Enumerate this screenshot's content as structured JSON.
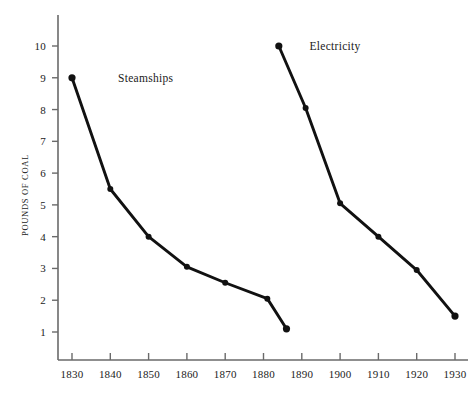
{
  "chart_data": {
    "type": "line",
    "title": "",
    "subtitle": "",
    "xlabel": "",
    "ylabel": "POUNDS OF COAL",
    "xlim": [
      1825,
      1935
    ],
    "ylim": [
      0,
      10.6
    ],
    "grid": false,
    "legend_position": "inline-annotation",
    "x_ticks": [
      1830,
      1840,
      1850,
      1860,
      1870,
      1880,
      1890,
      1900,
      1910,
      1920,
      1930
    ],
    "x_tick_labels": [
      "1830",
      "1840",
      "1850",
      "1860",
      "1870",
      "1880",
      "1890",
      "1900",
      "1910",
      "1920",
      "1930"
    ],
    "y_ticks": [
      1,
      2,
      3,
      4,
      5,
      6,
      7,
      8,
      9,
      10
    ],
    "y_tick_labels": [
      "1",
      "2",
      "3",
      "4",
      "5",
      "6",
      "7",
      "8",
      "9",
      "10"
    ],
    "line_color": "#111111",
    "marker_color": "#111111",
    "axis_color": "#6a6a6a",
    "background_color": "#ffffff",
    "series": [
      {
        "name": "Steamships",
        "label_x": 1842,
        "label_y": 9,
        "x": [
          1830,
          1840,
          1850,
          1860,
          1870,
          1881,
          1886
        ],
        "y": [
          9.0,
          5.5,
          4.0,
          3.05,
          2.55,
          2.05,
          1.1
        ],
        "points": [
          {
            "x": 1830,
            "y": 9.0
          },
          {
            "x": 1840,
            "y": 5.5
          },
          {
            "x": 1850,
            "y": 4.0
          },
          {
            "x": 1860,
            "y": 3.05
          },
          {
            "x": 1870,
            "y": 2.55
          },
          {
            "x": 1881,
            "y": 2.05
          },
          {
            "x": 1886,
            "y": 1.1
          }
        ]
      },
      {
        "name": "Electricity",
        "label_x": 1892,
        "label_y": 10,
        "x": [
          1884,
          1891,
          1900,
          1910,
          1920,
          1930
        ],
        "y": [
          10.0,
          8.05,
          5.05,
          4.0,
          2.95,
          1.5
        ],
        "points": [
          {
            "x": 1884,
            "y": 10.0
          },
          {
            "x": 1891,
            "y": 8.05
          },
          {
            "x": 1900,
            "y": 5.05
          },
          {
            "x": 1910,
            "y": 4.0
          },
          {
            "x": 1920,
            "y": 2.95
          },
          {
            "x": 1930,
            "y": 1.5
          }
        ]
      }
    ]
  }
}
